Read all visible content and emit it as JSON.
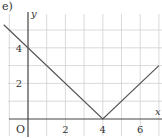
{
  "figure": {
    "label": "e)"
  },
  "chart_data": {
    "type": "line",
    "title": "",
    "panel_label": "e)",
    "xlabel": "x",
    "ylabel": "y",
    "origin_label": "O",
    "xlim": [
      -1.5,
      7
    ],
    "ylim": [
      -0.5,
      5.8
    ],
    "xticks": [
      2,
      4,
      6
    ],
    "xtick_labels": [
      "2",
      "4",
      "6"
    ],
    "yticks": [
      2,
      4
    ],
    "ytick_labels": [
      "2",
      "4"
    ],
    "grid": true,
    "grid_step": 1,
    "series": [
      {
        "name": "y = |x - 4|",
        "x": [
          -1.3,
          4,
          7
        ],
        "y": [
          5.3,
          0,
          3
        ]
      }
    ],
    "colors": {
      "line": "#555555",
      "grid": "#d0d0d0",
      "axis": "#444444"
    }
  }
}
